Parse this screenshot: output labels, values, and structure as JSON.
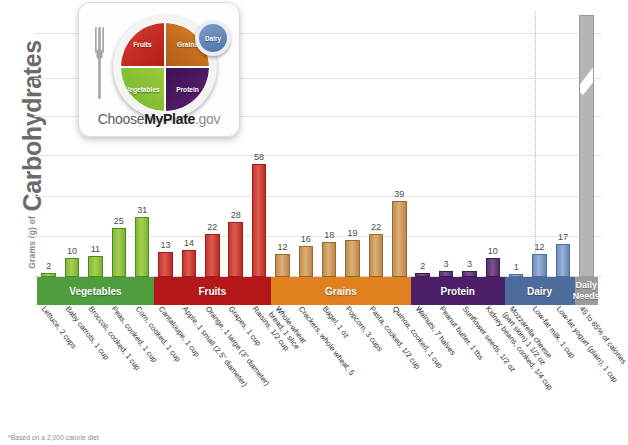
{
  "axis": {
    "y_title_small": "Grams (g) of",
    "y_title_big": "Carbohydrates"
  },
  "footnote": "*Based on a 2,000 calorie diet",
  "logo": {
    "fruits": "Fruits",
    "grains": "Grains",
    "vegetables": "Vegetables",
    "protein": "Protein",
    "dairy": "Dairy",
    "brand_pre": "Choose",
    "brand_mid": "MyPlate",
    "brand_post": ".gov"
  },
  "groups": [
    {
      "name": "Vegetables",
      "color": "#4e9e3e"
    },
    {
      "name": "Fruits",
      "color": "#b4161a"
    },
    {
      "name": "Grains",
      "color": "#e0801f"
    },
    {
      "name": "Protein",
      "color": "#4b2069"
    },
    {
      "name": "Dairy",
      "color": "#4e6c9b"
    },
    {
      "name": "Daily Needs",
      "color": "#9c9c9c"
    }
  ],
  "chart_data": {
    "type": "bar",
    "xlabel": "",
    "ylabel": "Grams (g) of Carbohydrates",
    "ylim": [
      0,
      58
    ],
    "grid": true,
    "legend": "none",
    "categories": [
      "Lettuce, 2 cups",
      "Baby carrots, 1 cup",
      "Broccoli, cooked, 1 cup",
      "Peas, cooked, 1 cup",
      "Corn, cooked, 1 cup",
      "Cantaloupe, 1 cup",
      "Apple, 1 small (2.5\" diameter)",
      "Orange, 1 large (3\" diameter)",
      "Grapes, 1 cup",
      "Raisins, 1/2 cup",
      "Whole-wheat bread, 1 slice",
      "Crackers, whole wheat, 5",
      "Bagel, 1 oz",
      "Popcorn, 3 cups",
      "Pasta, cooked, 1/2 cup",
      "Quinoa, cooked, 1 cup",
      "Walnuts, 7 halves",
      "Peanut butter, 1 tbs",
      "Sunflower seeds, 1/2 oz",
      "Kidney beans, cooked, 1/4 cup",
      "Mozzarella cheese (part skim) 1 1/2 oz",
      "Low-fat milk, 1 cup",
      "Low-fat yogurt (plain), 1 cup",
      "45 to 65% of calories"
    ],
    "values": [
      2,
      10,
      11,
      25,
      31,
      13,
      14,
      22,
      28,
      58,
      12,
      16,
      18,
      19,
      22,
      39,
      2,
      3,
      3,
      10,
      1,
      12,
      17,
      275
    ],
    "value_labels": [
      "2",
      "10",
      "11",
      "25",
      "31",
      "13",
      "14",
      "22",
      "28",
      "58",
      "12",
      "16",
      "18",
      "19",
      "22",
      "39",
      "2",
      "3",
      "3",
      "10",
      "1",
      "12",
      "17",
      "225 to\n325*"
    ],
    "group_of": [
      "Vegetables",
      "Vegetables",
      "Vegetables",
      "Vegetables",
      "Vegetables",
      "Fruits",
      "Fruits",
      "Fruits",
      "Fruits",
      "Fruits",
      "Grains",
      "Grains",
      "Grains",
      "Grains",
      "Grains",
      "Grains",
      "Protein",
      "Protein",
      "Protein",
      "Protein",
      "Dairy",
      "Dairy",
      "Dairy",
      "Daily Needs"
    ]
  }
}
